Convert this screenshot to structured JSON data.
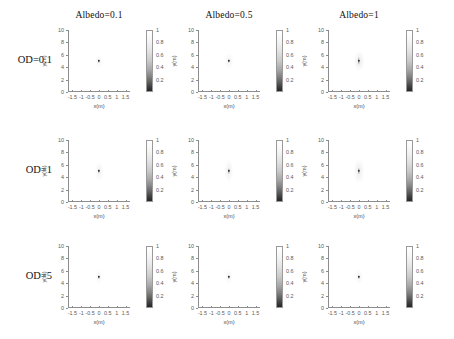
{
  "figure": {
    "type": "multi-panel-grid",
    "rows": 3,
    "cols": 3,
    "column_titles": [
      "Albedo=0.1",
      "Albedo=0.5",
      "Albedo=1"
    ],
    "row_titles": [
      "OD=0.1",
      "OD=1",
      "OD=5"
    ]
  },
  "axes": {
    "xlabel": "x(m)",
    "ylabel": "y(m)",
    "xticks": [
      "-1.5",
      "-1",
      "-0.5",
      "0",
      "0.5",
      "1",
      "1.5"
    ],
    "xtick_values": [
      -1.5,
      -1,
      -0.5,
      0,
      0.5,
      1,
      1.5
    ],
    "yticks": [
      "0",
      "2",
      "4",
      "6",
      "8",
      "10"
    ],
    "ytick_values": [
      0,
      2,
      4,
      6,
      8,
      10
    ],
    "xlim": [
      -1.75,
      1.75
    ],
    "ylim": [
      0,
      10
    ]
  },
  "colorbar": {
    "ticks": [
      "1",
      "0.8",
      "0.6",
      "0.4",
      "0.2"
    ],
    "tick_values": [
      1,
      0.8,
      0.6,
      0.4,
      0.2
    ],
    "vmin": 0.1,
    "vmax": 1.0,
    "colormap": "grayscale-inverted",
    "high_color": "#ffffff",
    "low_color": "#262626"
  },
  "chart_data": {
    "type": "heatmap",
    "title": "",
    "xlabel": "x(m)",
    "ylabel": "y(m)",
    "xlim": [
      -1.75,
      1.75
    ],
    "ylim": [
      0,
      10
    ],
    "grid": false,
    "colorbar_range": [
      0.1,
      1.0
    ],
    "categories_x": [
      "Albedo=0.1",
      "Albedo=0.5",
      "Albedo=1"
    ],
    "categories_y": [
      "OD=0.1",
      "OD=1",
      "OD=5"
    ],
    "panels": [
      {
        "row": "OD=0.1",
        "col": "Albedo=0.1",
        "source_x": 0,
        "source_y": 5,
        "peak_value": 0.15,
        "plume_width_m": 0.1,
        "plume_height_m": 0.55,
        "halo_width_m": 0.45,
        "halo_height_m": 2.2,
        "halo_strength": 0.055
      },
      {
        "row": "OD=0.1",
        "col": "Albedo=0.5",
        "source_x": 0,
        "source_y": 5,
        "peak_value": 0.14,
        "plume_width_m": 0.11,
        "plume_height_m": 0.7,
        "halo_width_m": 0.5,
        "halo_height_m": 2.6,
        "halo_strength": 0.07
      },
      {
        "row": "OD=0.1",
        "col": "Albedo=1",
        "source_x": 0,
        "source_y": 5,
        "peak_value": 0.13,
        "plume_width_m": 0.13,
        "plume_height_m": 1.3,
        "halo_width_m": 0.6,
        "halo_height_m": 3.4,
        "halo_strength": 0.1
      },
      {
        "row": "OD=1",
        "col": "Albedo=0.1",
        "source_x": 0,
        "source_y": 5,
        "peak_value": 0.17,
        "plume_width_m": 0.1,
        "plume_height_m": 0.8,
        "halo_width_m": 0.48,
        "halo_height_m": 3.0,
        "halo_strength": 0.075
      },
      {
        "row": "OD=1",
        "col": "Albedo=0.5",
        "source_x": 0,
        "source_y": 5,
        "peak_value": 0.16,
        "plume_width_m": 0.11,
        "plume_height_m": 0.95,
        "halo_width_m": 0.52,
        "halo_height_m": 3.6,
        "halo_strength": 0.085
      },
      {
        "row": "OD=1",
        "col": "Albedo=1",
        "source_x": 0,
        "source_y": 5,
        "peak_value": 0.15,
        "plume_width_m": 0.13,
        "plume_height_m": 1.1,
        "halo_width_m": 0.62,
        "halo_height_m": 4.0,
        "halo_strength": 0.095
      },
      {
        "row": "OD=5",
        "col": "Albedo=0.1",
        "source_x": 0,
        "source_y": 5,
        "peak_value": 0.2,
        "plume_width_m": 0.09,
        "plume_height_m": 0.6,
        "halo_width_m": 0.4,
        "halo_height_m": 2.4,
        "halo_strength": 0.06
      },
      {
        "row": "OD=5",
        "col": "Albedo=0.5",
        "source_x": 0,
        "source_y": 5,
        "peak_value": 0.19,
        "plume_width_m": 0.1,
        "plume_height_m": 0.6,
        "halo_width_m": 0.42,
        "halo_height_m": 2.4,
        "halo_strength": 0.06
      },
      {
        "row": "OD=5",
        "col": "Albedo=1",
        "source_x": 0,
        "source_y": 5,
        "peak_value": 0.18,
        "plume_width_m": 0.11,
        "plume_height_m": 0.65,
        "halo_width_m": 0.45,
        "halo_height_m": 2.6,
        "halo_strength": 0.065
      }
    ]
  }
}
